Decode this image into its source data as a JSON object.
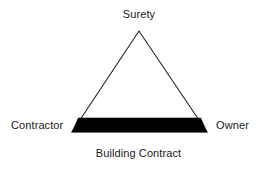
{
  "diagram": {
    "background_color": "#ffffff",
    "outline_color": "#2b2b2b",
    "fill_color": "#ffffff",
    "band_color": "#000000",
    "labels": {
      "apex": "Surety",
      "left": "Contractor",
      "right": "Owner",
      "base": "Building Contract"
    },
    "shape": {
      "type": "triangle",
      "apex": [
        139,
        31
      ],
      "base_left": [
        72,
        132
      ],
      "base_right": [
        207,
        132
      ],
      "band_top_y": 118,
      "band_bottom_y": 132
    }
  }
}
